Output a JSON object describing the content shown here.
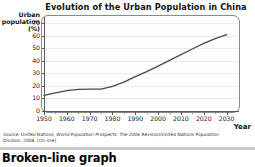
{
  "chart_data": {
    "type": "line",
    "title": "Evolution of the Urban Population in China",
    "xlabel": "Year",
    "ylabel": "Urban population (%)",
    "ylabel_lines": [
      "Urban",
      "population",
      "(%)"
    ],
    "xlim": [
      1950,
      2035
    ],
    "ylim": [
      0,
      75
    ],
    "grid": true,
    "legend": "none",
    "yticks": [
      0,
      10,
      20,
      30,
      40,
      50,
      60,
      70
    ],
    "ytick_labels": [
      "0",
      "10",
      "20",
      "30",
      "40",
      "50",
      "60",
      "70"
    ],
    "xticks": [
      1950,
      1960,
      1970,
      1980,
      1990,
      2000,
      2010,
      2020,
      2030
    ],
    "xtick_labels": [
      "1950",
      "1960",
      "1970",
      "1980",
      "1990",
      "2000",
      "2010",
      "2020",
      "2030"
    ],
    "xticks_minor": [
      1955,
      1965,
      1975,
      1985,
      1995,
      2005,
      2015,
      2025
    ],
    "series": [
      {
        "name": "Urban population (%)",
        "color": "#4a4a4a",
        "x": [
          1950,
          1955,
          1960,
          1965,
          1970,
          1975,
          1980,
          1985,
          1990,
          1995,
          2000,
          2005,
          2010,
          2015,
          2020,
          2025,
          2030
        ],
        "values": [
          12.5,
          14.5,
          16.2,
          17.3,
          17.4,
          17.4,
          19.6,
          23.0,
          27.4,
          31.4,
          35.8,
          40.4,
          45.0,
          49.5,
          53.9,
          57.8,
          61.0
        ]
      }
    ]
  },
  "source": {
    "line1_prefix": "Source:",
    "line1": "Source: United Nations, World Population Prospects: The 2006 Revision/United Nations Population Division,",
    "line2": "2008. [On line]"
  },
  "caption": {
    "text": "Broken-line graph"
  }
}
